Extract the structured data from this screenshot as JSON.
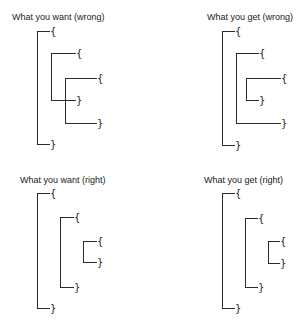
{
  "panels": [
    {
      "label": "What you want (wrong)",
      "label_pos": [
        12,
        12
      ],
      "brackets": [
        {
          "x": 37,
          "top": 31,
          "bottom": 144,
          "top_end": 49,
          "bottom_end": 49
        },
        {
          "x": 51,
          "top": 53,
          "bottom": 100,
          "top_end": 75,
          "bottom_end": 75
        },
        {
          "x": 65,
          "top": 78,
          "bottom": 123,
          "top_end": 96,
          "bottom_end": 96
        }
      ],
      "open_brace": "{",
      "close_brace": "}"
    },
    {
      "label": "What you get (wrong)",
      "label_pos": [
        207,
        12
      ],
      "brackets": [
        {
          "x": 222,
          "top": 31,
          "bottom": 145,
          "top_end": 234,
          "bottom_end": 234
        },
        {
          "x": 236,
          "top": 53,
          "bottom": 123,
          "top_end": 258,
          "bottom_end": 280
        },
        {
          "x": 246,
          "top": 78,
          "bottom": 100,
          "top_end": 280,
          "bottom_end": 258
        }
      ],
      "open_brace": "{",
      "close_brace": "}"
    },
    {
      "label": "What you want (right)",
      "label_pos": [
        20,
        175
      ],
      "brackets": [
        {
          "x": 37,
          "top": 193,
          "bottom": 308,
          "top_end": 49,
          "bottom_end": 49
        },
        {
          "x": 60,
          "top": 217,
          "bottom": 287,
          "top_end": 73,
          "bottom_end": 73
        },
        {
          "x": 83,
          "top": 241,
          "bottom": 262,
          "top_end": 96,
          "bottom_end": 96
        }
      ],
      "open_brace": "{",
      "close_brace": "}"
    },
    {
      "label": "What you get (right)",
      "label_pos": [
        204,
        175
      ],
      "brackets": [
        {
          "x": 222,
          "top": 193,
          "bottom": 308,
          "top_end": 234,
          "bottom_end": 234
        },
        {
          "x": 245,
          "top": 218,
          "bottom": 287,
          "top_end": 257,
          "bottom_end": 257
        },
        {
          "x": 268,
          "top": 241,
          "bottom": 263,
          "top_end": 279,
          "bottom_end": 279
        }
      ],
      "open_brace": "{",
      "close_brace": "}"
    }
  ]
}
